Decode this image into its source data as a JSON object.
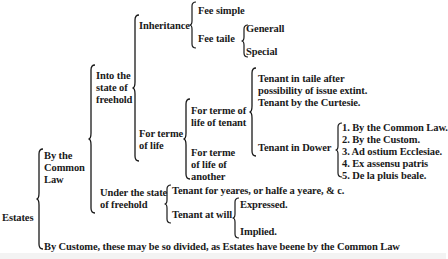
{
  "root": {
    "label": "Estates"
  },
  "common_law": {
    "label_lines": [
      "By the",
      "Common",
      "Law"
    ],
    "freehold": {
      "label_lines": [
        "Into the",
        "state of",
        "freehold"
      ],
      "inheritance": {
        "label": "Inheritance",
        "fee_simple": "Fee simple",
        "fee_taile": {
          "label": "Fee taile",
          "items": [
            "Generall",
            "Special"
          ]
        }
      },
      "terme_of_life": {
        "label_lines": [
          "For terme",
          "of life"
        ],
        "life_of_tenant": {
          "label_lines": [
            "For terme of",
            "life of tenant"
          ],
          "items": [
            "Tenant in taile after",
            "possibility of issue extint.",
            "Tenant by the Curtesie."
          ],
          "dower": {
            "label": "Tenant in Dower",
            "items": [
              "1. By the Common Law.",
              "2. By the Custom.",
              "3. Ad ostium Ecclesiae.",
              "4. Ex assensu patris",
              "5. De la pluis beale."
            ]
          }
        },
        "life_of_another": {
          "label_lines": [
            "For terme",
            "of life of",
            "another"
          ]
        }
      }
    },
    "under_freehold": {
      "label_lines": [
        "Under the state",
        "of freehold"
      ],
      "tenant_years": "Tenant for yeares, or halfe a yeare, & c.",
      "tenant_at_will": {
        "label": "Tenant at will",
        "items": [
          "Expressed.",
          "Implied."
        ]
      }
    }
  },
  "custom": {
    "label": "By Custome, these may be so divided, as Estates have beene by the Common Law"
  }
}
